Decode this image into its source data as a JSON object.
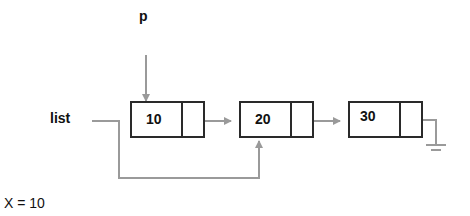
{
  "labels": {
    "pointer_p": "p",
    "head_list": "list",
    "variable": "X = 10"
  },
  "nodes": [
    {
      "value": "10",
      "next": "node-20"
    },
    {
      "value": "20",
      "next": "node-30"
    },
    {
      "value": "30",
      "next": "null (ground symbol)"
    }
  ],
  "colors": {
    "box_border": "#2a2a2a",
    "arrow": "#9a9a9a",
    "text": "#111111"
  }
}
